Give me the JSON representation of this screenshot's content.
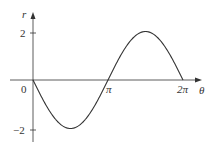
{
  "chart_data": {
    "type": "line",
    "title": "",
    "function": "r = -2 sin(theta)",
    "xlabel": "θ",
    "ylabel": "r",
    "x_ticks": [
      {
        "value": 0,
        "label": "0"
      },
      {
        "value": 3.14159,
        "label": "π"
      },
      {
        "value": 6.28319,
        "label": "2π"
      }
    ],
    "y_ticks": [
      {
        "value": 2,
        "label": "2"
      },
      {
        "value": -2,
        "label": "−2"
      }
    ],
    "xlim": [
      0,
      6.8
    ],
    "ylim": [
      -2.4,
      2.6
    ],
    "grid": false,
    "legend": null,
    "series": [
      {
        "name": "r",
        "x": [
          0,
          0.785,
          1.571,
          2.356,
          3.142,
          3.927,
          4.712,
          5.498,
          6.283
        ],
        "values": [
          0,
          -1.414,
          -2,
          -1.414,
          0,
          1.414,
          2,
          1.414,
          0
        ]
      }
    ],
    "colors": {
      "axis": "#333333",
      "curve": "#333333"
    }
  },
  "labels": {
    "r_axis": "r",
    "theta_axis": "θ",
    "origin": "0",
    "pi": "π",
    "two_pi": "2π",
    "tick_pos2": "2",
    "tick_neg2": "−2"
  }
}
